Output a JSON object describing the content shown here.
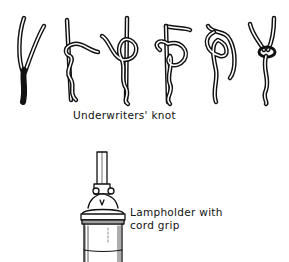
{
  "figure": {
    "knot_sequence": {
      "caption": "Underwriters' knot",
      "steps": [
        {
          "index": 1,
          "description": "Two cord conductors separated into a Y"
        },
        {
          "index": 2,
          "description": "Right conductor looped behind left"
        },
        {
          "index": 3,
          "description": "Loop formed around standing conductor"
        },
        {
          "index": 4,
          "description": "Second conductor passed over loop"
        },
        {
          "index": 5,
          "description": "End threaded through opposite loop"
        },
        {
          "index": 6,
          "description": "Knot pulled tight"
        }
      ]
    },
    "lampholder": {
      "caption_line1": "Lampholder with",
      "caption_line2": "cord grip"
    },
    "colors": {
      "ink": "#111111",
      "background": "#ffffff"
    }
  }
}
